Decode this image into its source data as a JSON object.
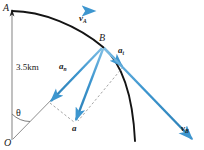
{
  "figure": {
    "background": "#ffffff",
    "colors": {
      "vector_blue": "#3d96cf",
      "vector_blue_dark": "#2b7fb5",
      "path_black": "#141414",
      "construction_gray": "#8a8a8a",
      "dashed_gray": "#9a9a9a",
      "label_black": "#1a1a1a"
    },
    "points": {
      "A": {
        "label": "A",
        "x": 12,
        "y": 12
      },
      "B": {
        "label": "B",
        "x": 103,
        "y": 47
      },
      "O": {
        "label": "O",
        "x": 12,
        "y": 140
      }
    },
    "dimension": {
      "label": "3.5km",
      "value": 3.5,
      "unit": "km",
      "description": "radius of circular path from O to A"
    },
    "angle": {
      "label": "θ",
      "description": "angle at O between vertical OA and radius OB"
    },
    "vectors": [
      {
        "name": "v_A",
        "base": "v",
        "sub": "A",
        "description": "velocity at A, horizontal to the right, tangent to path",
        "from": [
          12,
          12
        ],
        "to": [
          100,
          12
        ],
        "label_x": 80,
        "label_y": 17
      },
      {
        "name": "a_n",
        "base": "a",
        "sub": "n",
        "description": "normal (centripetal) acceleration at B, directed from B toward O",
        "from": [
          103,
          47
        ],
        "to": [
          49,
          103
        ],
        "label_x": 62,
        "label_y": 66
      },
      {
        "name": "a_t",
        "base": "a",
        "sub": "t",
        "description": "tangential acceleration at B, perpendicular to radius OB",
        "from": [
          103,
          47
        ],
        "to": [
          124,
          68
        ],
        "label_x": 121,
        "label_y": 50
      },
      {
        "name": "a",
        "base": "a",
        "sub": "",
        "description": "resultant acceleration at B, vector sum of a_n and a_t",
        "from": [
          103,
          47
        ],
        "to": [
          75,
          123
        ],
        "label_x": 73,
        "label_y": 132
      },
      {
        "name": "v_B",
        "base": "v",
        "sub": "B",
        "description": "velocity at B, tangent to path, directed down and to the right",
        "from": [
          103,
          47
        ],
        "to": [
          196,
          143
        ],
        "label_x": 182,
        "label_y": 128
      }
    ],
    "path": {
      "name": "circular-arc-path",
      "description": "black curved path from A through B continuing downward",
      "stroke": "#141414"
    },
    "construction_lines": [
      {
        "name": "radius-OA",
        "from": [
          12,
          12
        ],
        "to": [
          12,
          140
        ],
        "style": "solid-gray"
      },
      {
        "name": "radius-OB",
        "from": [
          12,
          140
        ],
        "to": [
          103,
          47
        ],
        "style": "solid-gray"
      },
      {
        "name": "parallelogram-side-from-an",
        "from": [
          49,
          103
        ],
        "to": [
          75,
          123
        ],
        "style": "dashed"
      },
      {
        "name": "parallelogram-side-from-at",
        "from": [
          124,
          68
        ],
        "to": [
          75,
          123
        ],
        "style": "dashed"
      }
    ]
  }
}
